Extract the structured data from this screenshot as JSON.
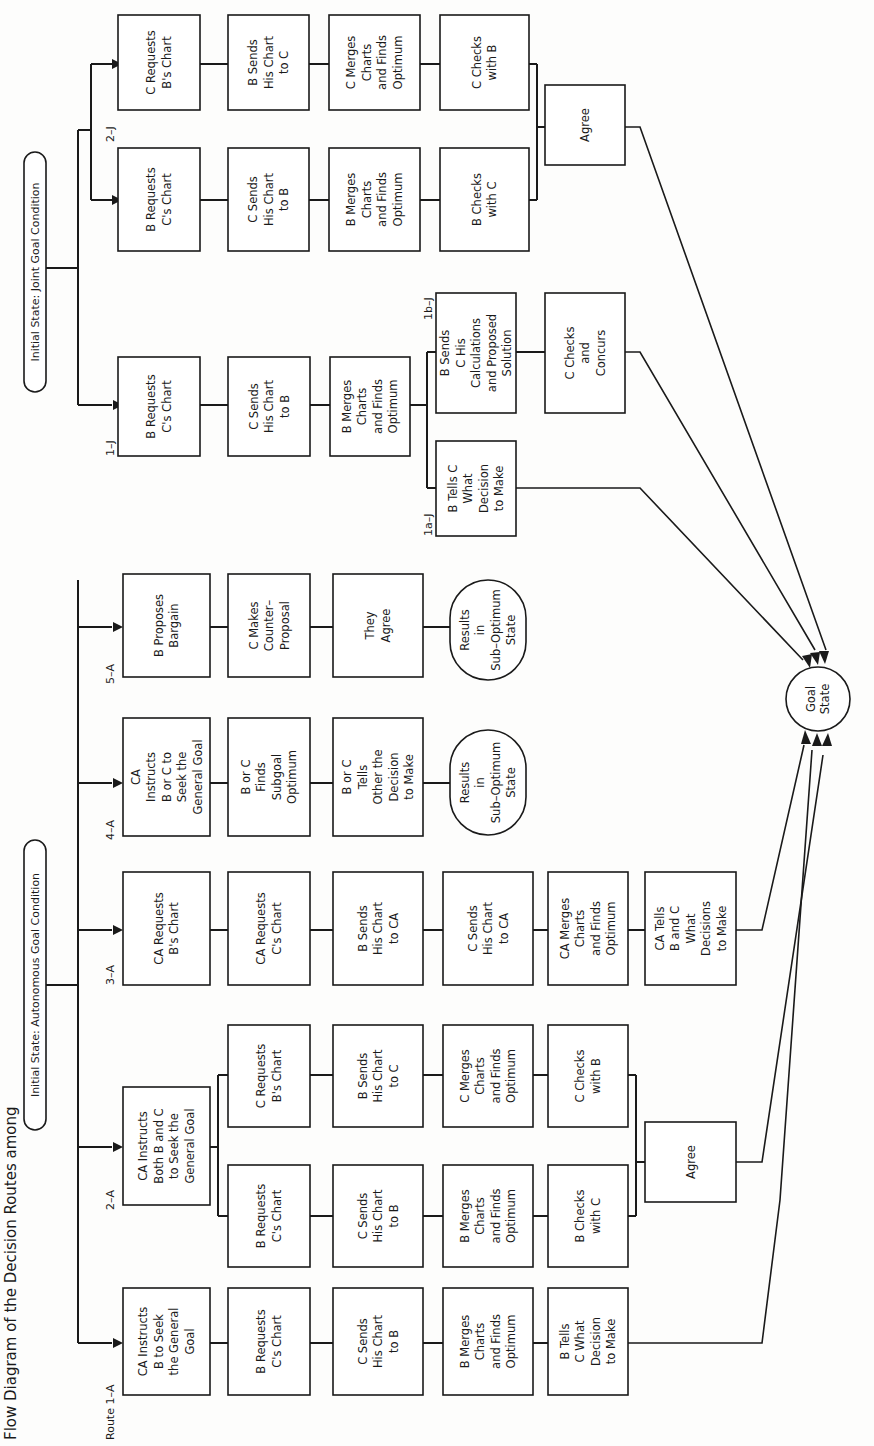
{
  "title": "Flow Diagram of the Decision Routes among",
  "initial_states": {
    "autonomous": "Initial State: Autonomous Goal Condition",
    "joint": "Initial State: Joint Goal Condition"
  },
  "goal_state": [
    "Goal",
    "State"
  ],
  "routes": {
    "r1A": {
      "label": "Route 1–A",
      "steps": [
        [
          "CA Instructs",
          "B to Seek",
          "the General",
          "Goal"
        ],
        [
          "B Requests",
          "C's Chart"
        ],
        [
          "C Sends",
          "His Chart",
          "to B"
        ],
        [
          "B Merges",
          "Charts",
          "and Finds",
          "Optimum"
        ],
        [
          "B Tells",
          "C What",
          "Decision",
          "to Make"
        ]
      ]
    },
    "r2A": {
      "label": "2–A",
      "start": [
        "CA Instructs",
        "Both B and C",
        "to Seek the",
        "General Goal"
      ],
      "branch_b": [
        [
          "B Requests",
          "C's Chart"
        ],
        [
          "C Sends",
          "His Chart",
          "to B"
        ],
        [
          "B Merges",
          "Charts",
          "and Finds",
          "Optimum"
        ],
        [
          "B Checks",
          "with C"
        ]
      ],
      "branch_c": [
        [
          "C Requests",
          "B's Chart"
        ],
        [
          "B Sends",
          "His Chart",
          "to C"
        ],
        [
          "C Merges",
          "Charts",
          "and Finds",
          "Optimum"
        ],
        [
          "C Checks",
          "with B"
        ]
      ],
      "agree": [
        "Agree"
      ]
    },
    "r3A": {
      "label": "3–A",
      "steps": [
        [
          "CA Requests",
          "B's Chart"
        ],
        [
          "CA Requests",
          "C's Chart"
        ],
        [
          "B Sends",
          "His Chart",
          "to CA"
        ],
        [
          "C Sends",
          "His Chart",
          "to CA"
        ],
        [
          "CA Merges",
          "Charts",
          "and Finds",
          "Optimum"
        ],
        [
          "CA Tells",
          "B and C",
          "What",
          "Decisions",
          "to Make"
        ]
      ]
    },
    "r4A": {
      "label": "4–A",
      "steps": [
        [
          "CA",
          "Instructs",
          "B or C to",
          "Seek the",
          "General Goal"
        ],
        [
          "B or C",
          "Finds",
          "Subgoal",
          "Optimum"
        ],
        [
          "B or C",
          "Tells",
          "Other the",
          "Decision",
          "to Make"
        ]
      ],
      "result": [
        "Results",
        "in",
        "Sub–Optimum",
        "State"
      ]
    },
    "r5A": {
      "label": "5–A",
      "steps": [
        [
          "B Proposes",
          "Bargain"
        ],
        [
          "C Makes",
          "Counter–",
          "Proposal"
        ],
        [
          "They",
          "Agree"
        ]
      ],
      "result": [
        "Results",
        "in",
        "Sub–Optimum",
        "State"
      ]
    },
    "r1J": {
      "label": "1–J",
      "steps": [
        [
          "B Requests",
          "C's Chart"
        ],
        [
          "C Sends",
          "His Chart",
          "to B"
        ],
        [
          "B Merges",
          "Charts",
          "and Finds",
          "Optimum"
        ]
      ],
      "branch_a_label": "1a–J",
      "branch_a": [
        [
          "B Tells C",
          "What",
          "Decision",
          "to Make"
        ]
      ],
      "branch_b_label": "1b–J",
      "branch_b": [
        [
          "B Sends",
          "C His",
          "Calculations",
          "and Proposed",
          "Solution"
        ],
        [
          "C Checks",
          "and",
          "Concurs"
        ]
      ]
    },
    "r2J": {
      "label": "2–J",
      "branch_b": [
        [
          "B Requests",
          "C's Chart"
        ],
        [
          "C Sends",
          "His Chart",
          "to B"
        ],
        [
          "B Merges",
          "Charts",
          "and Finds",
          "Optimum"
        ],
        [
          "B Checks",
          "with C"
        ]
      ],
      "branch_c": [
        [
          "C Requests",
          "B's Chart"
        ],
        [
          "B Sends",
          "His Chart",
          "to C"
        ],
        [
          "C Merges",
          "Charts",
          "and Finds",
          "Optimum"
        ],
        [
          "C Checks",
          "with B"
        ]
      ],
      "agree": [
        "Agree"
      ]
    }
  }
}
